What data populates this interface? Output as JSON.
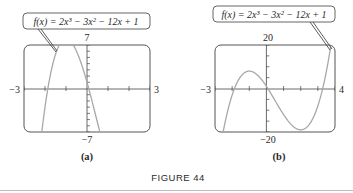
{
  "figure": {
    "title": "FIGURE 44",
    "function_label": "f(x) = 2x³ − 3x² − 12x + 1"
  },
  "chart_data": [
    {
      "type": "line",
      "panel": "(a)",
      "title": "f(x) = 2x^3 - 3x^2 - 12x + 1",
      "function": "2x^3 - 3x^2 - 12x + 1",
      "xlim": [
        -3,
        3
      ],
      "ylim": [
        -7,
        7
      ],
      "tick_labels": {
        "xmin": "−3",
        "xmax": "3",
        "ymin": "−7",
        "ymax": "7"
      },
      "x_ticks_step": 1,
      "y_ticks_step": 1,
      "grid": false,
      "caption": "(a)"
    },
    {
      "type": "line",
      "panel": "(b)",
      "title": "f(x) = 2x^3 - 3x^2 - 12x + 1",
      "function": "2x^3 - 3x^2 - 12x + 1",
      "xlim": [
        -3,
        4
      ],
      "ylim": [
        -20,
        20
      ],
      "tick_labels": {
        "xmin": "−3",
        "xmax": "4",
        "ymin": "−20",
        "ymax": "20"
      },
      "x_ticks_step": 1,
      "y_ticks_step": 5,
      "grid": false,
      "caption": "(b)"
    }
  ],
  "colors": {
    "curve": "#a8a8a8",
    "frame": "#555555",
    "axis": "#444444",
    "text": "#2a2a2a",
    "rule": "#bbbbbb"
  }
}
